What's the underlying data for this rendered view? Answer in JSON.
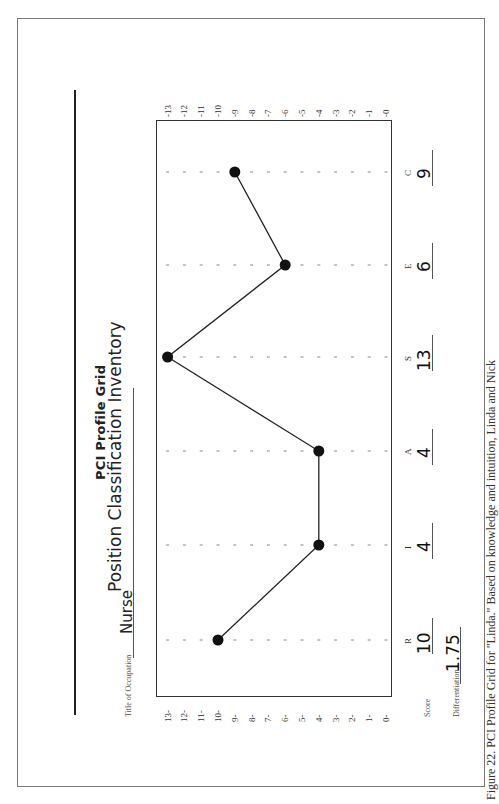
{
  "header": {
    "title": "Position Classification Inventory",
    "subtitle": "PCI Profile Grid"
  },
  "occupation": {
    "label": "Title of Occupation",
    "value": "Nurse"
  },
  "score_row": {
    "label": "Score"
  },
  "differentiation": {
    "label": "Differentiation",
    "value": "1.75"
  },
  "caption": "Figure 22. PCI Profile Grid for \"Linda.\" Based on knowledge and intuition, Linda and Nick",
  "axis": {
    "ticks": [
      "13",
      "12",
      "11",
      "10",
      "9",
      "8",
      "7",
      "6",
      "5",
      "4",
      "3",
      "2",
      "1",
      "0"
    ]
  },
  "chart_data": {
    "type": "line",
    "title": "PCI Profile Grid",
    "categories": [
      "R",
      "I",
      "A",
      "S",
      "E",
      "C"
    ],
    "series": [
      {
        "name": "Score",
        "values": [
          10,
          4,
          4,
          13,
          6,
          9
        ]
      }
    ],
    "xlabel": "",
    "ylabel": "Score",
    "ylim": [
      0,
      13
    ],
    "grid": "dotted tick marks at each integer per category",
    "annotations": {
      "occupation": "Nurse",
      "differentiation": 1.75
    },
    "orientation": "page rotated 90 degrees counter-clockwise"
  },
  "categories": [
    {
      "letter": "R",
      "score": "10"
    },
    {
      "letter": "I",
      "score": "4"
    },
    {
      "letter": "A",
      "score": "4"
    },
    {
      "letter": "S",
      "score": "13"
    },
    {
      "letter": "E",
      "score": "6"
    },
    {
      "letter": "C",
      "score": "9"
    }
  ]
}
